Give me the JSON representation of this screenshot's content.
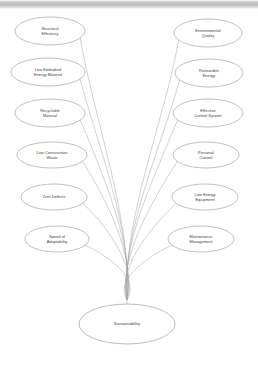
{
  "diagram": {
    "type": "radial-fan-tree",
    "root": {
      "label": "Sustainability",
      "cx": 127,
      "cy": 324,
      "rx": 48,
      "ry": 20
    },
    "converge_point": {
      "x": 127,
      "y": 300
    },
    "left_nodes": [
      {
        "label_line1": "Structural",
        "label_line2": "Efficiency",
        "cx": 50,
        "cy": 31,
        "rx": 35,
        "ry": 14
      },
      {
        "label_line1": "Low Embodied",
        "label_line2": "Energy Material",
        "cx": 48,
        "cy": 72,
        "rx": 37,
        "ry": 14
      },
      {
        "label_line1": "Recyclable",
        "label_line2": "Material",
        "cx": 50,
        "cy": 113,
        "rx": 35,
        "ry": 14
      },
      {
        "label_line1": "Low Construction",
        "label_line2": "Waste",
        "cx": 52,
        "cy": 155,
        "rx": 35,
        "ry": 13
      },
      {
        "label_line1": "Zero Defects",
        "label_line2": "",
        "cx": 54,
        "cy": 197,
        "rx": 33,
        "ry": 13
      },
      {
        "label_line1": "Speed of",
        "label_line2": "Adaptability",
        "cx": 57,
        "cy": 239,
        "rx": 32,
        "ry": 13
      }
    ],
    "right_nodes": [
      {
        "label_line1": "Environmental",
        "label_line2": "Quality",
        "cx": 208,
        "cy": 33,
        "rx": 34,
        "ry": 14
      },
      {
        "label_line1": "Renewable",
        "label_line2": "Energy",
        "cx": 209,
        "cy": 73,
        "rx": 34,
        "ry": 14
      },
      {
        "label_line1": "Effective",
        "label_line2": "Control System",
        "cx": 208,
        "cy": 113,
        "rx": 35,
        "ry": 14
      },
      {
        "label_line1": "Personal",
        "label_line2": "Control",
        "cx": 206,
        "cy": 155,
        "rx": 33,
        "ry": 13
      },
      {
        "label_line1": "Low Energy",
        "label_line2": "Equipment",
        "cx": 205,
        "cy": 197,
        "rx": 33,
        "ry": 13
      },
      {
        "label_line1": "Maintenance",
        "label_line2": "Management",
        "cx": 201,
        "cy": 239,
        "rx": 33,
        "ry": 13
      }
    ],
    "colors": {
      "node_stroke": "#8d8d8d",
      "branch_stroke": "#a2a2a2",
      "text": "#3b3b3b",
      "background": "#ffffff",
      "top_band": "#bdbdbd"
    }
  }
}
